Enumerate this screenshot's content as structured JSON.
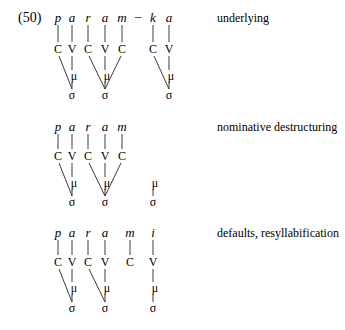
{
  "example": {
    "number": "(50)",
    "stages": [
      {
        "label": "underlying",
        "segments": [
          {
            "text": "p",
            "x": 58
          },
          {
            "text": "a",
            "x": 72
          },
          {
            "text": "r",
            "x": 88
          },
          {
            "text": "a",
            "x": 105
          },
          {
            "text": "m",
            "x": 122
          },
          {
            "text": "–",
            "x": 138
          },
          {
            "text": "k",
            "x": 153
          },
          {
            "text": "a",
            "x": 169
          }
        ],
        "skeleton": [
          {
            "text": "C",
            "x": 58
          },
          {
            "text": "V",
            "x": 72
          },
          {
            "text": "C",
            "x": 88
          },
          {
            "text": "V",
            "x": 105
          },
          {
            "text": "C",
            "x": 122
          },
          {
            "text": "C",
            "x": 153
          },
          {
            "text": "V",
            "x": 169
          }
        ],
        "moras": [
          {
            "text": "μ",
            "x": 72
          },
          {
            "text": "μ",
            "x": 105
          },
          {
            "text": "μ",
            "x": 169
          }
        ],
        "syllables": [
          {
            "text": "σ",
            "x": 72
          },
          {
            "text": "σ",
            "x": 105
          },
          {
            "text": "σ",
            "x": 169
          }
        ]
      },
      {
        "label": "nominative destructuring",
        "segments": [
          {
            "text": "p",
            "x": 58
          },
          {
            "text": "a",
            "x": 72
          },
          {
            "text": "r",
            "x": 88
          },
          {
            "text": "a",
            "x": 105
          },
          {
            "text": "m",
            "x": 122
          }
        ],
        "skeleton": [
          {
            "text": "C",
            "x": 58
          },
          {
            "text": "V",
            "x": 72
          },
          {
            "text": "C",
            "x": 88
          },
          {
            "text": "V",
            "x": 105
          },
          {
            "text": "C",
            "x": 122
          }
        ],
        "moras": [
          {
            "text": "μ",
            "x": 72
          },
          {
            "text": "μ",
            "x": 105
          },
          {
            "text": "μ",
            "x": 153
          }
        ],
        "syllables": [
          {
            "text": "σ",
            "x": 72
          },
          {
            "text": "σ",
            "x": 105
          },
          {
            "text": "σ",
            "x": 153
          }
        ]
      },
      {
        "label": "defaults, resyllabification",
        "segments": [
          {
            "text": "p",
            "x": 58
          },
          {
            "text": "a",
            "x": 72
          },
          {
            "text": "r",
            "x": 88
          },
          {
            "text": "a",
            "x": 105
          },
          {
            "text": "m",
            "x": 130
          },
          {
            "text": "i",
            "x": 153
          }
        ],
        "skeleton": [
          {
            "text": "C",
            "x": 58
          },
          {
            "text": "V",
            "x": 72
          },
          {
            "text": "C",
            "x": 88
          },
          {
            "text": "V",
            "x": 105
          },
          {
            "text": "C",
            "x": 130
          },
          {
            "text": "V",
            "x": 153
          }
        ],
        "moras": [
          {
            "text": "μ",
            "x": 72
          },
          {
            "text": "μ",
            "x": 105
          },
          {
            "text": "μ",
            "x": 153
          }
        ],
        "syllables": [
          {
            "text": "σ",
            "x": 72
          },
          {
            "text": "σ",
            "x": 105
          },
          {
            "text": "σ",
            "x": 153
          }
        ]
      }
    ]
  }
}
